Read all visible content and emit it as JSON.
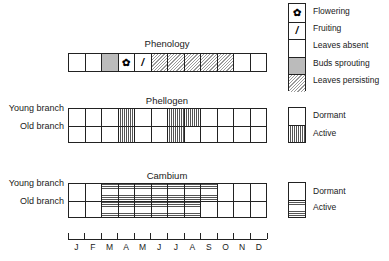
{
  "legend_phenology": [
    {
      "key": "flowering",
      "label": "Flowering",
      "icon": "flower-icon",
      "glyph": "✿"
    },
    {
      "key": "fruiting",
      "label": "Fruiting",
      "icon": "fruit-icon",
      "glyph": "/"
    },
    {
      "key": "absent",
      "label": "Leaves absent"
    },
    {
      "key": "sprouting",
      "label": "Buds sprouting"
    },
    {
      "key": "persisting",
      "label": "Leaves persisting"
    }
  ],
  "legend_phellogen": {
    "dormant": "Dormant",
    "active": "Active"
  },
  "legend_cambium": {
    "dormant": "Dormant",
    "active": "Active"
  },
  "sections": {
    "phenology": {
      "title": "Phenology"
    },
    "phellogen": {
      "title": "Phellogen",
      "rows": [
        "Young branch",
        "Old branch"
      ]
    },
    "cambium": {
      "title": "Cambium",
      "rows": [
        "Young branch",
        "Old branch"
      ]
    }
  },
  "months": [
    "J",
    "F",
    "M",
    "A",
    "M",
    "J",
    "J",
    "A",
    "S",
    "O",
    "N",
    "D"
  ],
  "chart_data": {
    "type": "table",
    "categories": [
      "J",
      "F",
      "M",
      "A",
      "M",
      "J",
      "J",
      "A",
      "S",
      "O",
      "N",
      "D"
    ],
    "phenology": [
      "absent",
      "absent",
      "sprouting",
      "flowering",
      "fruiting",
      "persisting",
      "persisting",
      "persisting",
      "persisting",
      "persisting",
      "absent",
      "absent"
    ],
    "phellogen": {
      "Young branch": [
        "dormant",
        "dormant",
        "dormant",
        "active",
        "dormant",
        "dormant",
        "active",
        "active",
        "dormant",
        "dormant",
        "dormant",
        "dormant"
      ],
      "Old branch": [
        "dormant",
        "dormant",
        "dormant",
        "active",
        "dormant",
        "dormant",
        "active",
        "dormant",
        "dormant",
        "dormant",
        "dormant",
        "dormant"
      ]
    },
    "cambium": {
      "Young branch": [
        "dormant",
        "dormant",
        "active",
        "active",
        "active",
        "active",
        "active",
        "active",
        "active",
        "dormant",
        "dormant",
        "dormant"
      ],
      "Old branch": [
        "dormant",
        "dormant",
        "active",
        "active",
        "active",
        "active",
        "active",
        "active",
        "dormant",
        "dormant",
        "dormant",
        "dormant"
      ]
    }
  }
}
